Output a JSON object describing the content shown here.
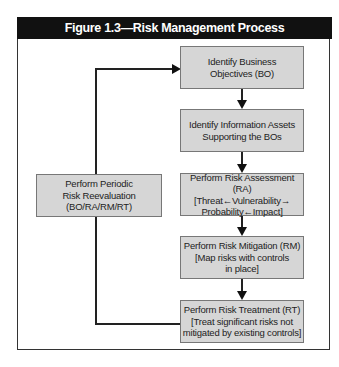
{
  "figure": {
    "title": "Figure 1.3—Risk Management Process"
  },
  "steps": [
    {
      "id": "BO",
      "text": "Identify Business\nObjectives (BO)"
    },
    {
      "id": "assets",
      "text": "Identify Information Assets\nSupporting the BOs"
    },
    {
      "id": "RA",
      "text": "Perform Risk Assessment (RA)\n[Threat←Vulnerability→\nProbability←Impact]"
    },
    {
      "id": "RM",
      "text": "Perform Risk Mitigation (RM)\n[Map risks with controls\nin place]"
    },
    {
      "id": "RT",
      "text": "Perform Risk Treatment (RT)\n[Treat significant risks not\nmitigated by existing controls]"
    }
  ],
  "reevaluation": {
    "text": "Perform Periodic\nRisk Reevaluation\n(BO/RA/RM/RT)"
  },
  "colors": {
    "header_bg": "#111111",
    "box_fill": "#d6d6d6",
    "line": "#222222"
  }
}
